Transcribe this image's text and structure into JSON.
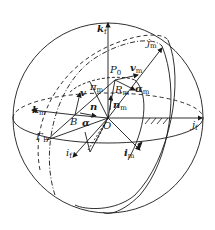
{
  "diagram": {
    "type": "3D sphere coordinate frame diagram",
    "labels": {
      "k_f": {
        "main": "k",
        "sub": "f"
      },
      "j_m": {
        "main": "j",
        "sub": "m"
      },
      "P0": {
        "main": "P",
        "sub": "0"
      },
      "v_m": {
        "main": "v",
        "sub": "m"
      },
      "pi_m": {
        "main": "π",
        "sub": "m"
      },
      "R_m": {
        "main": "R",
        "sub": "m"
      },
      "alpha_m": {
        "main": "α",
        "sub": "m"
      },
      "v": {
        "main": "v"
      },
      "n_m": {
        "main": "n",
        "sub": "m"
      },
      "k_m": {
        "main": "k",
        "sub": "m"
      },
      "n": {
        "main": "n"
      },
      "B": {
        "main": "B"
      },
      "alpha": {
        "main": "α"
      },
      "O": {
        "main": "O"
      },
      "j_f": {
        "main": "j",
        "sub": "f"
      },
      "Gamma_B": {
        "main": "Γ",
        "sub": "B"
      },
      "i_f": {
        "main": "i",
        "sub": "f"
      },
      "i_m": {
        "main": "i",
        "sub": "m"
      }
    },
    "colors": {
      "line": "#1a1a1a",
      "background": "#ffffff"
    }
  }
}
